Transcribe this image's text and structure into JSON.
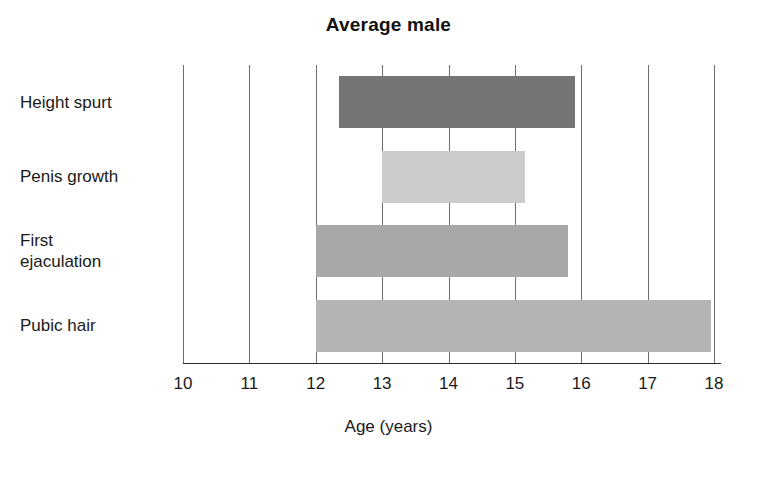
{
  "chart_data": {
    "type": "bar",
    "orientation": "horizontal",
    "title": "Average male",
    "xlabel": "Age (years)",
    "ylabel": "",
    "xlim": [
      10,
      18
    ],
    "xticks": [
      10,
      11,
      12,
      13,
      14,
      15,
      16,
      17,
      18
    ],
    "xtick_labels": [
      "10",
      "11",
      "12",
      "13",
      "14",
      "15",
      "16",
      "17",
      "18"
    ],
    "grid": true,
    "grid_axis": "x",
    "legend": false,
    "note": "Each bar is a range (span) bar showing the typical age interval for each pubertal event.",
    "categories": [
      "Height spurt",
      "Penis growth",
      "First\nejaculation",
      "Pubic hair"
    ],
    "bars": [
      {
        "label": "Height spurt",
        "start": 12.35,
        "end": 15.9,
        "duration": 3.55,
        "color": "#757575"
      },
      {
        "label": "Penis growth",
        "start": 13.0,
        "end": 15.15,
        "duration": 2.15,
        "color": "#cccccc"
      },
      {
        "label": "First ejaculation",
        "start": 12.0,
        "end": 15.8,
        "duration": 3.8,
        "color": "#a8a8a8"
      },
      {
        "label": "Pubic hair",
        "start": 12.0,
        "end": 17.95,
        "duration": 5.95,
        "color": "#b4b4b4"
      }
    ]
  },
  "colors": {
    "background": "#ffffff",
    "text": "#1a1a1a",
    "axis": "#2b2b2b",
    "gridline": "#6d6d6d"
  }
}
